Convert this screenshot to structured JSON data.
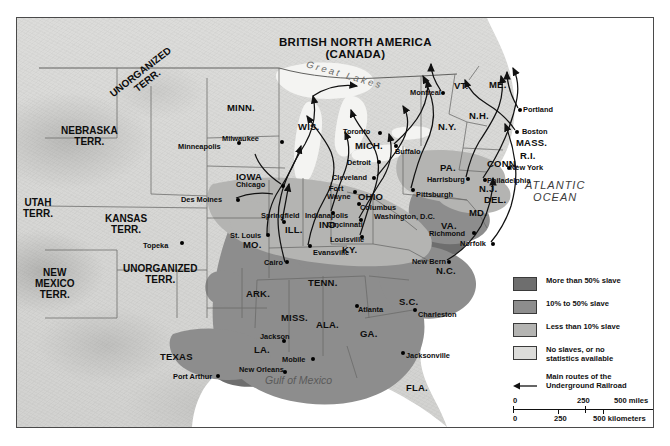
{
  "map": {
    "title_country": "BRITISH NORTH AMERICA",
    "title_country_sub": "(CANADA)",
    "oceans": [
      {
        "name": "atlantic-ocean-label",
        "line1": "ATLANTIC",
        "line2": "OCEAN"
      },
      {
        "name": "gulf-of-mexico-label",
        "text": "Gulf of Mexico"
      },
      {
        "name": "great-lakes-label",
        "text": "Great Lakes"
      }
    ],
    "territories": [
      {
        "name": "unorganized-terr-north",
        "line1": "UNORGANIZED",
        "line2": "TERR."
      },
      {
        "name": "nebraska-terr",
        "line1": "NEBRASKA",
        "line2": "TERR."
      },
      {
        "name": "utah-terr",
        "line1": "UTAH",
        "line2": "TERR."
      },
      {
        "name": "kansas-terr",
        "line1": "KANSAS",
        "line2": "TERR."
      },
      {
        "name": "unorganized-terr-south",
        "line1": "UNORGANIZED",
        "line2": "TERR."
      },
      {
        "name": "new-mexico-terr",
        "line1": "NEW",
        "line2": "MEXICO",
        "line3": "TERR."
      }
    ],
    "states": [
      {
        "label": "MINN.",
        "x": 210,
        "y": 85
      },
      {
        "label": "WIS.",
        "x": 281,
        "y": 104
      },
      {
        "label": "MICH.",
        "x": 338,
        "y": 123
      },
      {
        "label": "IOWA",
        "x": 219,
        "y": 154
      },
      {
        "label": "ILL.",
        "x": 268,
        "y": 207
      },
      {
        "label": "IND.",
        "x": 302,
        "y": 202
      },
      {
        "label": "OHIO",
        "x": 341,
        "y": 174
      },
      {
        "label": "KY.",
        "x": 325,
        "y": 227
      },
      {
        "label": "MO.",
        "x": 226,
        "y": 222
      },
      {
        "label": "TENN.",
        "x": 291,
        "y": 260
      },
      {
        "label": "ARK.",
        "x": 229,
        "y": 271
      },
      {
        "label": "MISS.",
        "x": 264,
        "y": 295
      },
      {
        "label": "ALA.",
        "x": 299,
        "y": 302
      },
      {
        "label": "GA.",
        "x": 343,
        "y": 311
      },
      {
        "label": "LA.",
        "x": 237,
        "y": 327
      },
      {
        "label": "FLA.",
        "x": 389,
        "y": 365
      },
      {
        "label": "S.C.",
        "x": 382,
        "y": 279
      },
      {
        "label": "N.C.",
        "x": 419,
        "y": 248
      },
      {
        "label": "VA.",
        "x": 424,
        "y": 203
      },
      {
        "label": "MD.",
        "x": 452,
        "y": 190
      },
      {
        "label": "DEL.",
        "x": 467,
        "y": 177
      },
      {
        "label": "N.J.",
        "x": 462,
        "y": 166
      },
      {
        "label": "PA.",
        "x": 423,
        "y": 145
      },
      {
        "label": "N.Y.",
        "x": 421,
        "y": 104
      },
      {
        "label": "VT.",
        "x": 437,
        "y": 63
      },
      {
        "label": "N.H.",
        "x": 452,
        "y": 93
      },
      {
        "label": "ME.",
        "x": 472,
        "y": 62
      },
      {
        "label": "MASS.",
        "x": 499,
        "y": 120
      },
      {
        "label": "R.I.",
        "x": 503,
        "y": 133
      },
      {
        "label": "CONN.",
        "x": 470,
        "y": 141
      },
      {
        "label": "TEXAS",
        "x": 143,
        "y": 334
      }
    ],
    "cities": [
      {
        "label": "Minneapolis",
        "lx": 161,
        "ly": 125,
        "dx": 220,
        "dy": 123
      },
      {
        "label": "Milwaukee",
        "lx": 205,
        "ly": 117,
        "dx": 263,
        "dy": 122
      },
      {
        "label": "Chicago",
        "lx": 219,
        "ly": 163,
        "dx": 264,
        "dy": 166
      },
      {
        "label": "Des Moines",
        "lx": 164,
        "ly": 178,
        "dx": 219,
        "dy": 180
      },
      {
        "label": "Topeka",
        "lx": 126,
        "ly": 224,
        "dx": 163,
        "dy": 223
      },
      {
        "label": "Springfield",
        "lx": 244,
        "ly": 194,
        "dx": 265,
        "dy": 202
      },
      {
        "label": "St. Louis",
        "lx": 213,
        "ly": 214,
        "dx": 249,
        "dy": 215
      },
      {
        "label": "Cairo",
        "lx": 247,
        "ly": 241,
        "dx": 268,
        "dy": 242
      },
      {
        "label": "Evansville",
        "lx": 296,
        "ly": 231,
        "dx": 291,
        "dy": 226
      },
      {
        "label": "Indianapolis",
        "lx": 288,
        "ly": 194,
        "dx": 314,
        "dy": 193
      },
      {
        "label": "Fort",
        "lx": 312,
        "ly": 167,
        "dx": 336,
        "dy": 172
      },
      {
        "label": "Wayne",
        "lx": 310,
        "ly": 175,
        "dx": -1,
        "dy": -1
      },
      {
        "label": "Louisville",
        "lx": 313,
        "ly": 218,
        "dx": 343,
        "dy": 217
      },
      {
        "label": "Cincinnati",
        "lx": 310,
        "ly": 203,
        "dx": 342,
        "dy": 200
      },
      {
        "label": "Columbus",
        "lx": 343,
        "ly": 186,
        "dx": 340,
        "dy": 184
      },
      {
        "label": "Cleveland",
        "lx": 315,
        "ly": 156,
        "dx": 355,
        "dy": 158
      },
      {
        "label": "Detroit",
        "lx": 330,
        "ly": 141,
        "dx": 360,
        "dy": 142
      },
      {
        "label": "Toronto",
        "lx": 326,
        "ly": 110,
        "dx": 361,
        "dy": 113
      },
      {
        "label": "Buffalo",
        "lx": 378,
        "ly": 130,
        "dx": 377,
        "dy": 126
      },
      {
        "label": "Montreal",
        "lx": 393,
        "ly": 71,
        "dx": 424,
        "dy": 73
      },
      {
        "label": "Portland",
        "lx": 506,
        "ly": 88,
        "dx": 501,
        "dy": 90
      },
      {
        "label": "Boston",
        "lx": 505,
        "ly": 110,
        "dx": 498,
        "dy": 112
      },
      {
        "label": "New York",
        "lx": 493,
        "ly": 146,
        "dx": 490,
        "dy": 148
      },
      {
        "label": "Philadelphia",
        "lx": 470,
        "ly": 159,
        "dx": 466,
        "dy": 160
      },
      {
        "label": "Harrisburg",
        "lx": 410,
        "ly": 158,
        "dx": 449,
        "dy": 159
      },
      {
        "label": "Pittsburgh",
        "lx": 399,
        "ly": 173,
        "dx": 394,
        "dy": 170
      },
      {
        "label": "Washington, D.C.",
        "lx": 357,
        "ly": 195,
        "dx": -1,
        "dy": -1
      },
      {
        "label": "Richmond",
        "lx": 412,
        "ly": 212,
        "dx": 455,
        "dy": 213
      },
      {
        "label": "Norfolk",
        "lx": 443,
        "ly": 222,
        "dx": 474,
        "dy": 224
      },
      {
        "label": "New Bern",
        "lx": 395,
        "ly": 240,
        "dx": 430,
        "dy": 242
      },
      {
        "label": "Charleston",
        "lx": 401,
        "ly": 293,
        "dx": 396,
        "dy": 290
      },
      {
        "label": "Atlanta",
        "lx": 341,
        "ly": 288,
        "dx": 338,
        "dy": 286
      },
      {
        "label": "Jacksonville",
        "lx": 389,
        "ly": 334,
        "dx": 384,
        "dy": 333
      },
      {
        "label": "Jackson",
        "lx": 243,
        "ly": 315,
        "dx": 265,
        "dy": 321
      },
      {
        "label": "Mobile",
        "lx": 265,
        "ly": 338,
        "dx": 294,
        "dy": 339
      },
      {
        "label": "New Orleans",
        "lx": 222,
        "ly": 348,
        "dx": 266,
        "dy": 352
      },
      {
        "label": "Port Arthur",
        "lx": 156,
        "ly": 355,
        "dx": 199,
        "dy": 356
      }
    ]
  },
  "legend": {
    "items": [
      {
        "name": "legend-more-than-50",
        "color": "#6e6e6e",
        "line1": "More than 50% slave",
        "line2": ""
      },
      {
        "name": "legend-10-to-50",
        "color": "#8d8d8d",
        "line1": "10% to 50% slave",
        "line2": ""
      },
      {
        "name": "legend-less-than-10",
        "color": "#b4b4b2",
        "line1": "Less than 10% slave",
        "line2": ""
      },
      {
        "name": "legend-no-slaves",
        "color": "#dcdcda",
        "line1": "No slaves, or no",
        "line2": "statistics available"
      }
    ],
    "route": {
      "line1": "Main routes of the",
      "line2": "Underground Railroad"
    }
  },
  "scale": {
    "miles": {
      "zero": "0",
      "mid": "250",
      "max": "500 miles"
    },
    "kilometers": {
      "zero": "0",
      "mid": "250",
      "max": "500 kilometers"
    }
  }
}
